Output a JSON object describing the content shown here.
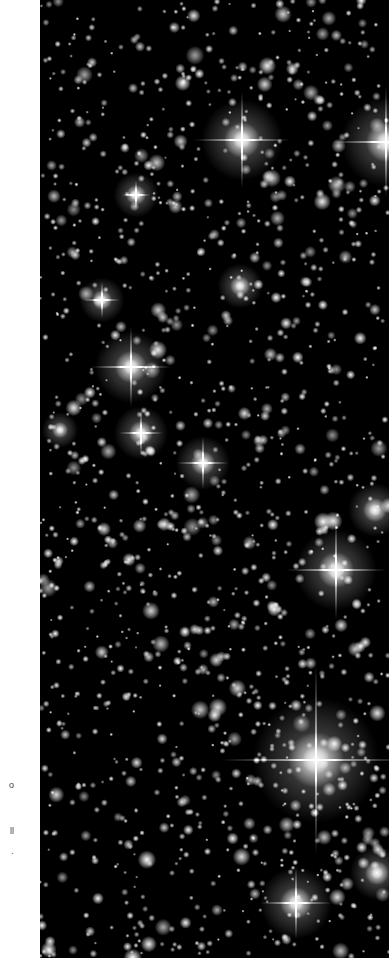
{
  "image": {
    "description": "Astronomical star field (dense star cluster) in grayscale",
    "background_color": "#000000",
    "margin_color": "#ffffff",
    "field": {
      "x": 40,
      "y": 0,
      "width": 349,
      "height": 958
    }
  },
  "margin_fragments": [
    {
      "text": "o",
      "top": 780
    },
    {
      "text": "ll",
      "top": 826
    },
    {
      "text": "·",
      "top": 848
    }
  ],
  "bright_stars": [
    {
      "x": 242,
      "y": 140,
      "r": 9,
      "spike": 48
    },
    {
      "x": 386,
      "y": 142,
      "r": 10,
      "spike": 55
    },
    {
      "x": 131,
      "y": 367,
      "r": 8,
      "spike": 40
    },
    {
      "x": 141,
      "y": 433,
      "r": 6,
      "spike": 22
    },
    {
      "x": 203,
      "y": 463,
      "r": 6,
      "spike": 26
    },
    {
      "x": 336,
      "y": 570,
      "r": 9,
      "spike": 50
    },
    {
      "x": 316,
      "y": 760,
      "r": 14,
      "spike": 95
    },
    {
      "x": 296,
      "y": 903,
      "r": 8,
      "spike": 36
    },
    {
      "x": 102,
      "y": 300,
      "r": 5,
      "spike": 18
    },
    {
      "x": 136,
      "y": 195,
      "r": 5,
      "spike": 14
    },
    {
      "x": 375,
      "y": 510,
      "r": 6,
      "spike": 0
    },
    {
      "x": 377,
      "y": 873,
      "r": 6,
      "spike": 0
    },
    {
      "x": 240,
      "y": 286,
      "r": 5,
      "spike": 0
    },
    {
      "x": 60,
      "y": 430,
      "r": 4,
      "spike": 0
    }
  ],
  "faint_star_count": 1400,
  "seed": 7
}
